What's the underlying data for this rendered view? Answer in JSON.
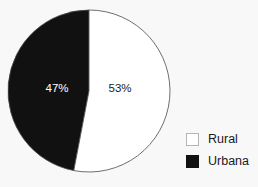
{
  "chart_data": {
    "type": "pie",
    "title": "",
    "subtitle": "",
    "xlabel": "",
    "ylabel": "",
    "grid": false,
    "legend_position": "bottom-right",
    "start_angle_deg": 0,
    "direction": "clockwise",
    "categories": [
      "Rural",
      "Urbana"
    ],
    "values": [
      53,
      47
    ],
    "unit": "%",
    "slices": [
      {
        "label": "Rural",
        "value": 53,
        "data_label": "53%",
        "color": "#ffffff",
        "label_color": "#1a1a1a",
        "start_deg": 0,
        "end_deg": 190.8
      },
      {
        "label": "Urbana",
        "value": 47,
        "data_label": "47%",
        "color": "#111111",
        "label_color": "#ffffff",
        "start_deg": 190.8,
        "end_deg": 360
      }
    ],
    "legend": [
      {
        "label": "Rural",
        "color": "#ffffff"
      },
      {
        "label": "Urbana",
        "color": "#111111"
      }
    ],
    "colors": {
      "background": "#f8f8f8",
      "outline": "#4a4a4a",
      "rural": "#ffffff",
      "urbana": "#111111"
    }
  },
  "labels": {
    "slice_rural": "53%",
    "slice_urbana": "47%"
  },
  "legend": {
    "rural_label": "Rural",
    "urbana_label": "Urbana"
  }
}
